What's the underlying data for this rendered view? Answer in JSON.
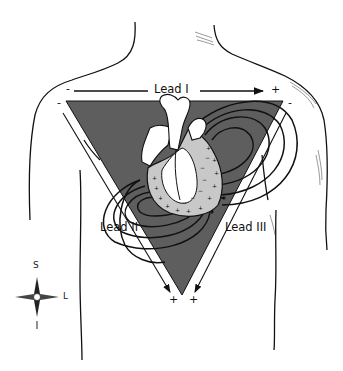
{
  "diagram": {
    "colors": {
      "triangle_fill": "#5e5e5e",
      "line": "#111111",
      "heart_fill": "#ffffff",
      "myocardium_fill": "#c8c8c8",
      "background": "#ffffff"
    },
    "leads": [
      {
        "id": "lead-1",
        "label": "Lead I",
        "negative": "-",
        "positive": "+"
      },
      {
        "id": "lead-2",
        "label": "Lead II",
        "negative": "-",
        "positive": "+"
      },
      {
        "id": "lead-3",
        "label": "Lead III",
        "negative": "-",
        "positive": "+"
      }
    ],
    "compass": {
      "superior": "S",
      "left": "L"
    }
  }
}
